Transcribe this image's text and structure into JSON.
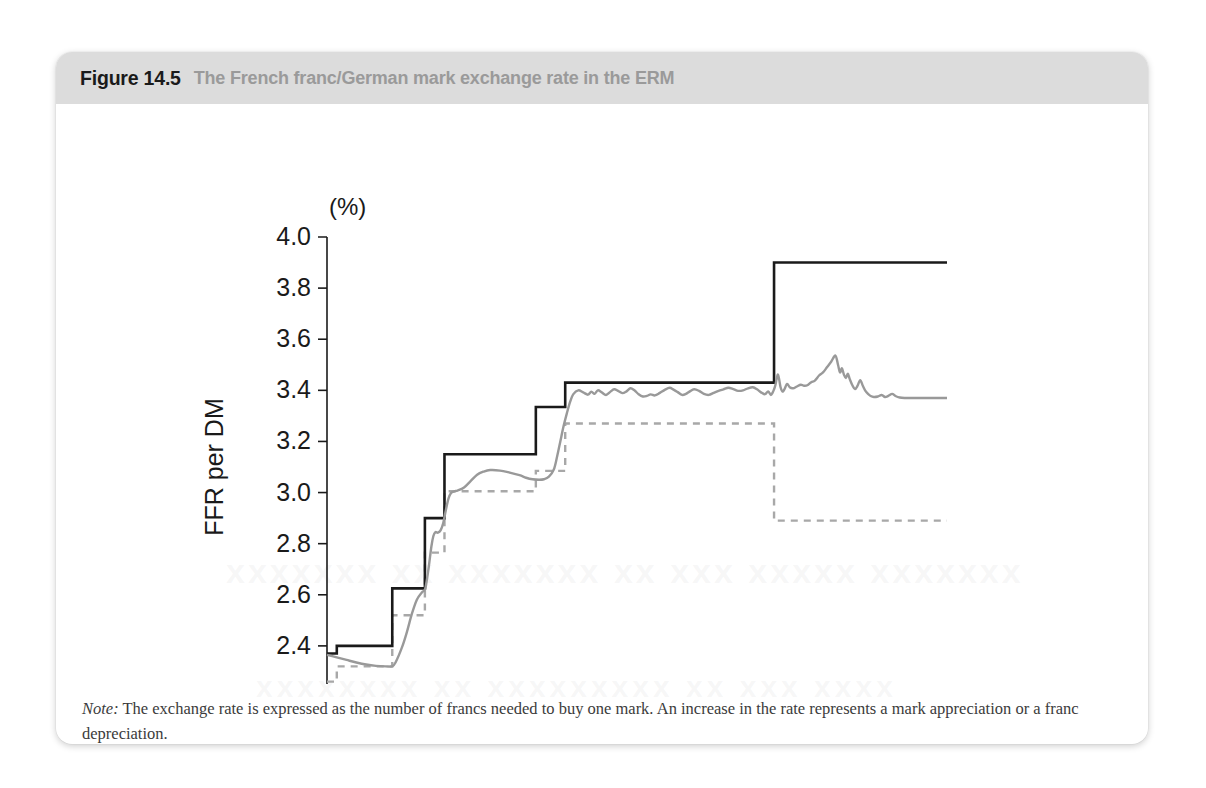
{
  "figure": {
    "number": "Figure 14.5",
    "title": "The French franc/German mark exchange rate in the ERM",
    "note_label": "Note:",
    "note_text": " The exchange rate is expressed as the number of francs needed to buy one mark. An increase in the rate represents a mark appreciation or a franc depreciation."
  },
  "colors": {
    "header_band": "#dcdcdc",
    "figure_number": "#1a1a1a",
    "figure_title": "#9a9a9a",
    "upper_band_line": "#1a1a1a",
    "lower_band_line": "#a8a8a8",
    "actual_rate_line": "#999999",
    "axis": "#1a1a1a",
    "note_text": "#3b3b3b"
  },
  "chart_data": {
    "type": "line",
    "title": "The French franc/German mark exchange rate in the ERM",
    "xlabel": "",
    "ylabel": "FFR per DM",
    "y_unit_label": "(%)",
    "ylim": [
      2.2,
      4.0
    ],
    "ytick_step": 0.2,
    "yticks": [
      "2.2",
      "2.4",
      "2.6",
      "2.8",
      "3.0",
      "3.2",
      "3.4",
      "3.6",
      "3.8",
      "4.0"
    ],
    "xticks": [
      "1979",
      "1981",
      "1982",
      "1984",
      "1985",
      "1987",
      "1989",
      "1990",
      "1992",
      "1993",
      "1995",
      "1996",
      "1998"
    ],
    "xlim": [
      1979,
      1998
    ],
    "grid": false,
    "legend": "none",
    "series": [
      {
        "name": "Upper band limit",
        "style": "solid",
        "color": "#1a1a1a",
        "step": true,
        "points": [
          [
            1979.0,
            2.37
          ],
          [
            1979.3,
            2.37
          ],
          [
            1979.3,
            2.4
          ],
          [
            1981.0,
            2.4
          ],
          [
            1981.0,
            2.625
          ],
          [
            1982.0,
            2.625
          ],
          [
            1982.0,
            2.9
          ],
          [
            1982.6,
            2.9
          ],
          [
            1982.6,
            3.15
          ],
          [
            1985.4,
            3.15
          ],
          [
            1985.4,
            3.335
          ],
          [
            1986.3,
            3.335
          ],
          [
            1986.3,
            3.43
          ],
          [
            1992.7,
            3.43
          ],
          [
            1992.7,
            3.9
          ],
          [
            1998.0,
            3.9
          ]
        ]
      },
      {
        "name": "Lower band limit",
        "style": "dashed",
        "color": "#a8a8a8",
        "step": true,
        "points": [
          [
            1979.0,
            2.26
          ],
          [
            1979.3,
            2.26
          ],
          [
            1979.3,
            2.32
          ],
          [
            1981.0,
            2.32
          ],
          [
            1981.0,
            2.52
          ],
          [
            1982.0,
            2.52
          ],
          [
            1982.0,
            2.765
          ],
          [
            1982.6,
            2.765
          ],
          [
            1982.6,
            3.005
          ],
          [
            1985.4,
            3.005
          ],
          [
            1985.4,
            3.085
          ],
          [
            1986.3,
            3.085
          ],
          [
            1986.3,
            3.27
          ],
          [
            1992.7,
            3.27
          ],
          [
            1992.7,
            2.89
          ],
          [
            1998.0,
            2.89
          ]
        ]
      },
      {
        "name": "Actual exchange rate",
        "style": "solid",
        "color": "#999999",
        "step": false,
        "points": [
          [
            1979.0,
            2.365
          ],
          [
            1979.3,
            2.355
          ],
          [
            1979.6,
            2.345
          ],
          [
            1979.9,
            2.335
          ],
          [
            1980.2,
            2.327
          ],
          [
            1980.5,
            2.322
          ],
          [
            1980.8,
            2.32
          ],
          [
            1981.0,
            2.32
          ],
          [
            1981.1,
            2.335
          ],
          [
            1981.3,
            2.395
          ],
          [
            1981.45,
            2.455
          ],
          [
            1981.6,
            2.525
          ],
          [
            1981.75,
            2.58
          ],
          [
            1981.9,
            2.608
          ],
          [
            1982.0,
            2.62
          ],
          [
            1982.05,
            2.65
          ],
          [
            1982.12,
            2.71
          ],
          [
            1982.2,
            2.79
          ],
          [
            1982.26,
            2.83
          ],
          [
            1982.32,
            2.845
          ],
          [
            1982.4,
            2.843
          ],
          [
            1982.48,
            2.852
          ],
          [
            1982.56,
            2.88
          ],
          [
            1982.64,
            2.93
          ],
          [
            1982.72,
            2.975
          ],
          [
            1982.8,
            2.998
          ],
          [
            1982.9,
            3.005
          ],
          [
            1983.0,
            3.008
          ],
          [
            1983.2,
            3.02
          ],
          [
            1983.4,
            3.045
          ],
          [
            1983.6,
            3.07
          ],
          [
            1983.8,
            3.082
          ],
          [
            1984.0,
            3.088
          ],
          [
            1984.3,
            3.086
          ],
          [
            1984.6,
            3.078
          ],
          [
            1984.9,
            3.068
          ],
          [
            1985.1,
            3.058
          ],
          [
            1985.3,
            3.052
          ],
          [
            1985.5,
            3.05
          ],
          [
            1985.65,
            3.052
          ],
          [
            1985.8,
            3.062
          ],
          [
            1985.95,
            3.09
          ],
          [
            1986.05,
            3.14
          ],
          [
            1986.15,
            3.2
          ],
          [
            1986.25,
            3.26
          ],
          [
            1986.35,
            3.31
          ],
          [
            1986.45,
            3.355
          ],
          [
            1986.55,
            3.385
          ],
          [
            1986.7,
            3.4
          ],
          [
            1986.85,
            3.392
          ],
          [
            1987.0,
            3.383
          ],
          [
            1987.1,
            3.395
          ],
          [
            1987.2,
            3.386
          ],
          [
            1987.3,
            3.4
          ],
          [
            1987.42,
            3.392
          ],
          [
            1987.55,
            3.382
          ],
          [
            1987.68,
            3.394
          ],
          [
            1987.8,
            3.404
          ],
          [
            1987.92,
            3.398
          ],
          [
            1988.05,
            3.389
          ],
          [
            1988.18,
            3.396
          ],
          [
            1988.3,
            3.408
          ],
          [
            1988.42,
            3.4
          ],
          [
            1988.55,
            3.385
          ],
          [
            1988.68,
            3.376
          ],
          [
            1988.8,
            3.378
          ],
          [
            1988.92,
            3.384
          ],
          [
            1989.05,
            3.38
          ],
          [
            1989.2,
            3.39
          ],
          [
            1989.35,
            3.402
          ],
          [
            1989.5,
            3.41
          ],
          [
            1989.62,
            3.403
          ],
          [
            1989.75,
            3.393
          ],
          [
            1989.88,
            3.382
          ],
          [
            1990.0,
            3.386
          ],
          [
            1990.12,
            3.396
          ],
          [
            1990.25,
            3.404
          ],
          [
            1990.4,
            3.398
          ],
          [
            1990.55,
            3.386
          ],
          [
            1990.7,
            3.382
          ],
          [
            1990.85,
            3.39
          ],
          [
            1991.0,
            3.398
          ],
          [
            1991.15,
            3.404
          ],
          [
            1991.3,
            3.41
          ],
          [
            1991.45,
            3.405
          ],
          [
            1991.6,
            3.398
          ],
          [
            1991.75,
            3.4
          ],
          [
            1991.9,
            3.408
          ],
          [
            1992.05,
            3.412
          ],
          [
            1992.18,
            3.404
          ],
          [
            1992.3,
            3.392
          ],
          [
            1992.42,
            3.385
          ],
          [
            1992.52,
            3.396
          ],
          [
            1992.6,
            3.382
          ],
          [
            1992.66,
            3.392
          ],
          [
            1992.7,
            3.404
          ],
          [
            1992.74,
            3.42
          ],
          [
            1992.78,
            3.445
          ],
          [
            1992.82,
            3.462
          ],
          [
            1992.86,
            3.44
          ],
          [
            1992.9,
            3.412
          ],
          [
            1992.96,
            3.395
          ],
          [
            1993.02,
            3.405
          ],
          [
            1993.1,
            3.425
          ],
          [
            1993.18,
            3.412
          ],
          [
            1993.28,
            3.408
          ],
          [
            1993.4,
            3.415
          ],
          [
            1993.52,
            3.422
          ],
          [
            1993.62,
            3.418
          ],
          [
            1993.72,
            3.42
          ],
          [
            1993.84,
            3.432
          ],
          [
            1993.95,
            3.438
          ],
          [
            1994.08,
            3.458
          ],
          [
            1994.2,
            3.47
          ],
          [
            1994.32,
            3.49
          ],
          [
            1994.45,
            3.512
          ],
          [
            1994.58,
            3.536
          ],
          [
            1994.66,
            3.5
          ],
          [
            1994.72,
            3.47
          ],
          [
            1994.78,
            3.486
          ],
          [
            1994.84,
            3.462
          ],
          [
            1994.9,
            3.448
          ],
          [
            1994.96,
            3.465
          ],
          [
            1995.02,
            3.444
          ],
          [
            1995.1,
            3.42
          ],
          [
            1995.18,
            3.405
          ],
          [
            1995.26,
            3.418
          ],
          [
            1995.34,
            3.44
          ],
          [
            1995.42,
            3.418
          ],
          [
            1995.5,
            3.398
          ],
          [
            1995.58,
            3.386
          ],
          [
            1995.66,
            3.378
          ],
          [
            1995.76,
            3.374
          ],
          [
            1995.88,
            3.376
          ],
          [
            1996.0,
            3.382
          ],
          [
            1996.1,
            3.374
          ],
          [
            1996.2,
            3.378
          ],
          [
            1996.32,
            3.386
          ],
          [
            1996.42,
            3.378
          ],
          [
            1996.55,
            3.372
          ],
          [
            1996.7,
            3.37
          ],
          [
            1996.9,
            3.37
          ],
          [
            1997.2,
            3.37
          ],
          [
            1997.6,
            3.37
          ],
          [
            1998.0,
            3.37
          ]
        ]
      }
    ]
  },
  "ghost_text": {
    "line1": "xxxxxxx xx xxxxxxx xx xxx xxxxx xxxxxxx",
    "line2": "xxxxxxxx xx xxxxxxxxx xx xxx xxxx"
  }
}
